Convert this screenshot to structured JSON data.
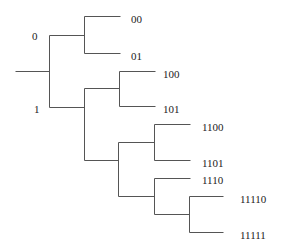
{
  "diagram": {
    "type": "binary-tree",
    "colors": {
      "line": "#555555",
      "text": "#222222",
      "background": "#ffffff"
    },
    "edge_labels": [
      {
        "id": "branch-0",
        "text": "0",
        "x": 32,
        "y": 37
      },
      {
        "id": "branch-1",
        "text": "1",
        "x": 34,
        "y": 110
      }
    ],
    "leaves": [
      {
        "code": "00",
        "x": 131,
        "y": 20
      },
      {
        "code": "01",
        "x": 131,
        "y": 57
      },
      {
        "code": "100",
        "x": 163,
        "y": 75
      },
      {
        "code": "101",
        "x": 163,
        "y": 110
      },
      {
        "code": "1100",
        "x": 202,
        "y": 128
      },
      {
        "code": "1101",
        "x": 202,
        "y": 164
      },
      {
        "code": "1110",
        "x": 202,
        "y": 181
      },
      {
        "code": "11110",
        "x": 240,
        "y": 200
      },
      {
        "code": "11111",
        "x": 240,
        "y": 236
      }
    ],
    "segments": [
      {
        "id": "root-stem",
        "x1": 15,
        "y1": 71,
        "x2": 49,
        "y2": 71
      },
      {
        "id": "root-vertical",
        "x1": 49,
        "y1": 35,
        "x2": 49,
        "y2": 107
      },
      {
        "id": "to-node-0",
        "x1": 49,
        "y1": 35,
        "x2": 84,
        "y2": 35
      },
      {
        "id": "to-node-1",
        "x1": 49,
        "y1": 107,
        "x2": 84,
        "y2": 107
      },
      {
        "id": "node-0-vertical",
        "x1": 84,
        "y1": 16,
        "x2": 84,
        "y2": 53
      },
      {
        "id": "leaf-00",
        "x1": 84,
        "y1": 16,
        "x2": 120,
        "y2": 16
      },
      {
        "id": "leaf-01",
        "x1": 84,
        "y1": 53,
        "x2": 120,
        "y2": 53
      },
      {
        "id": "node-1-vertical",
        "x1": 84,
        "y1": 88,
        "x2": 84,
        "y2": 160
      },
      {
        "id": "to-node-10",
        "x1": 84,
        "y1": 88,
        "x2": 119,
        "y2": 88
      },
      {
        "id": "to-node-11",
        "x1": 84,
        "y1": 160,
        "x2": 118,
        "y2": 160
      },
      {
        "id": "node-10-vertical",
        "x1": 119,
        "y1": 71,
        "x2": 119,
        "y2": 106
      },
      {
        "id": "leaf-100",
        "x1": 119,
        "y1": 71,
        "x2": 155,
        "y2": 71
      },
      {
        "id": "leaf-101",
        "x1": 119,
        "y1": 106,
        "x2": 155,
        "y2": 106
      },
      {
        "id": "node-11-vertical",
        "x1": 118,
        "y1": 142,
        "x2": 118,
        "y2": 196
      },
      {
        "id": "to-node-110",
        "x1": 118,
        "y1": 142,
        "x2": 154,
        "y2": 142
      },
      {
        "id": "to-node-111",
        "x1": 118,
        "y1": 196,
        "x2": 154,
        "y2": 196
      },
      {
        "id": "node-110-vertical",
        "x1": 154,
        "y1": 124,
        "x2": 154,
        "y2": 160
      },
      {
        "id": "leaf-1100",
        "x1": 154,
        "y1": 124,
        "x2": 190,
        "y2": 124
      },
      {
        "id": "leaf-1101",
        "x1": 154,
        "y1": 160,
        "x2": 190,
        "y2": 160
      },
      {
        "id": "node-111-vertical",
        "x1": 154,
        "y1": 178,
        "x2": 154,
        "y2": 214
      },
      {
        "id": "leaf-1110",
        "x1": 154,
        "y1": 178,
        "x2": 190,
        "y2": 178
      },
      {
        "id": "to-node-1111",
        "x1": 154,
        "y1": 214,
        "x2": 189,
        "y2": 214
      },
      {
        "id": "node-1111-vertical",
        "x1": 189,
        "y1": 196,
        "x2": 189,
        "y2": 232
      },
      {
        "id": "leaf-11110",
        "x1": 189,
        "y1": 196,
        "x2": 223,
        "y2": 196
      },
      {
        "id": "leaf-11111",
        "x1": 189,
        "y1": 232,
        "x2": 223,
        "y2": 232
      }
    ]
  }
}
